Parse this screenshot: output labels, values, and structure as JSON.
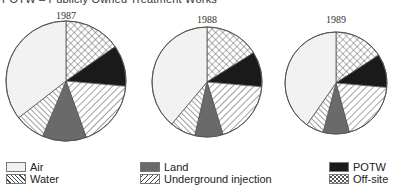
{
  "title": "POTW – Publicly Owned Treatment Works",
  "chart_data": {
    "type": "pie",
    "title": "POTW – Publicly Owned Treatment Works",
    "legend_position": "bottom",
    "categories": [
      "Off-site",
      "POTW",
      "Underground injection",
      "Land",
      "Water",
      "Air"
    ],
    "colors": {
      "Air": "#f2f2f2",
      "Water": "hatch-backslash",
      "Land": "#6a6a6a",
      "Underground injection": "hatch-slash",
      "POTW": "#1a1a1a",
      "Off-site": "crosshatch"
    },
    "charts": [
      {
        "label": "1987",
        "values_percent": {
          "Off-site": 15.3,
          "POTW": 11.1,
          "Underground injection": 18.1,
          "Land": 11.9,
          "Water": 8.1,
          "Air": 35.5
        }
      },
      {
        "label": "1988",
        "values_percent": {
          "Off-site": 16.1,
          "POTW": 10.3,
          "Underground injection": 18.9,
          "Land": 8.3,
          "Water": 7.5,
          "Air": 38.9
        }
      },
      {
        "label": "1989",
        "values_percent": {
          "Off-site": 15.8,
          "POTW": 10.6,
          "Underground injection": 19.4,
          "Land": 8.3,
          "Water": 5.6,
          "Air": 40.3
        }
      }
    ]
  },
  "pies": [
    {
      "year": "1987",
      "cx": 66,
      "cy": 81,
      "r": 60
    },
    {
      "year": "1988",
      "cx": 207,
      "cy": 82,
      "r": 55
    },
    {
      "year": "1989",
      "cx": 336,
      "cy": 83,
      "r": 51
    }
  ],
  "legend": [
    {
      "label": "Air",
      "key": "Air"
    },
    {
      "label": "Water",
      "key": "Water"
    },
    {
      "label": "Land",
      "key": "Land"
    },
    {
      "label": "Underground injection",
      "key": "Underground injection"
    },
    {
      "label": "POTW",
      "key": "POTW"
    },
    {
      "label": "Off-site",
      "key": "Off-site"
    }
  ]
}
